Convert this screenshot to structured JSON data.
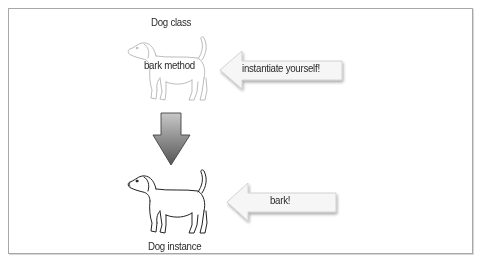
{
  "diagram": {
    "class_node": {
      "title": "Dog class",
      "method_label": "bark method",
      "icon": "dog-outline-icon",
      "style": "faded"
    },
    "instance_node": {
      "title": "Dog instance",
      "icon": "dog-outline-icon",
      "style": "solid"
    },
    "transition_arrow": {
      "direction": "down",
      "icon": "down-arrow-icon",
      "color_top": "#bdbdbd",
      "color_bottom": "#5a5a5a"
    },
    "callouts": [
      {
        "label": "instantiate yourself!",
        "direction": "left",
        "target": "Dog class"
      },
      {
        "label": "bark!",
        "direction": "left",
        "target": "Dog instance"
      }
    ]
  }
}
